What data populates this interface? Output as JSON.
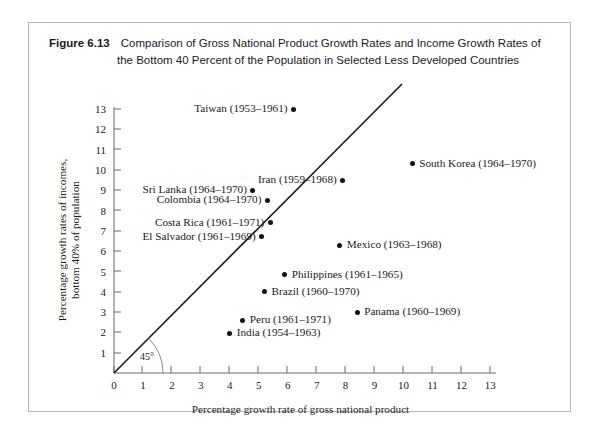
{
  "figure": {
    "label": "Figure 6.13",
    "caption": "Comparison of Gross National Product Growth Rates and Income Growth Rates of the Bottom 40 Percent of the Population in Selected Less Developed Countries"
  },
  "chart_data": {
    "type": "scatter",
    "title": "Comparison of Gross National Product Growth Rates and Income Growth Rates of the Bottom 40 Percent of the Population in Selected Less Developed Countries",
    "xlabel": "Percentage growth rate of gross national product",
    "ylabel": "Percentage growth rates of incomes, bottom 40% of population",
    "xlim": [
      0,
      13.8
    ],
    "ylim": [
      0,
      13.6
    ],
    "xticks": [
      "0",
      "1",
      "2",
      "3",
      "4",
      "5",
      "6",
      "7",
      "8",
      "9",
      "10",
      "11",
      "12",
      "13"
    ],
    "yticks": [
      "1",
      "2",
      "3",
      "4",
      "5",
      "6",
      "7",
      "8",
      "9",
      "10",
      "11",
      "12",
      "13"
    ],
    "grid": false,
    "legend": null,
    "annotations": [
      {
        "name": "forty-five-degree-line",
        "text": "45°",
        "description": "diagonal reference line y = x through the origin"
      }
    ],
    "points": [
      {
        "label": "Taiwan (1953–1961)",
        "x": 6.2,
        "y": 13.0,
        "label_side": "left"
      },
      {
        "label": "South Korea (1964–1970)",
        "x": 10.3,
        "y": 10.3,
        "label_side": "right"
      },
      {
        "label": "Iran (1959–1968)",
        "x": 7.9,
        "y": 9.5,
        "label_side": "left"
      },
      {
        "label": "Sri Lanka (1964–1970)",
        "x": 4.8,
        "y": 9.0,
        "label_side": "left"
      },
      {
        "label": "Colombia (1964–1970)",
        "x": 5.3,
        "y": 8.5,
        "label_side": "left"
      },
      {
        "label": "Costa Rica (1961–1971)",
        "x": 5.4,
        "y": 7.4,
        "label_side": "left"
      },
      {
        "label": "El Salvador (1961–1969)",
        "x": 5.1,
        "y": 6.7,
        "label_side": "left"
      },
      {
        "label": "Mexico (1963–1968)",
        "x": 7.8,
        "y": 6.3,
        "label_side": "right"
      },
      {
        "label": "Philippines (1961–1965)",
        "x": 5.9,
        "y": 4.85,
        "label_side": "right"
      },
      {
        "label": "Brazil (1960–1970)",
        "x": 5.2,
        "y": 4.0,
        "label_side": "right"
      },
      {
        "label": "Panama (1960–1969)",
        "x": 8.4,
        "y": 3.0,
        "label_side": "right"
      },
      {
        "label": "Peru (1961–1971)",
        "x": 4.45,
        "y": 2.6,
        "label_side": "right"
      },
      {
        "label": "India (1954–1963)",
        "x": 4.0,
        "y": 1.95,
        "label_side": "right"
      }
    ]
  },
  "colors": {
    "point": "#111111",
    "axis": "#6b6b6b",
    "line": "#1a1a1a",
    "frame": "#b8b8b8"
  }
}
